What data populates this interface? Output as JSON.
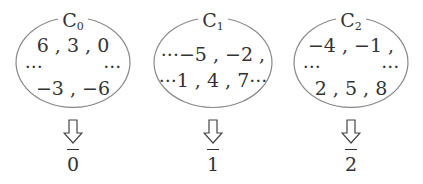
{
  "diagram": {
    "classes": [
      {
        "name": "C",
        "index": "0",
        "rows": [
          "6 , 3 , 0",
          "···          ···",
          "−3 , −6"
        ],
        "representative": "0"
      },
      {
        "name": "C",
        "index": "1",
        "rows": [
          "···−5 , −2 ,",
          "···1 , 4 , 7···"
        ],
        "representative": "1"
      },
      {
        "name": "C",
        "index": "2",
        "rows": [
          "−4 , −1 ,",
          "···          ···",
          "2 , 5 , 8"
        ],
        "representative": "2"
      }
    ],
    "arrow_icon": "down-hollow-arrow",
    "stroke_color": "#888888",
    "text_color": "#333333"
  }
}
